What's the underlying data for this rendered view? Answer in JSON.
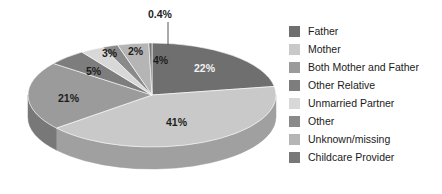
{
  "chart_data": {
    "type": "pie",
    "title": "",
    "subtitle": "",
    "xlabel": "",
    "ylabel": "",
    "three_d": true,
    "legend_position": "right",
    "grid": false,
    "categories": [
      "Father",
      "Mother",
      "Both Mother and Father",
      "Other Relative",
      "Unmarried Partner",
      "Other",
      "Unknown/missing",
      "Childcare Provider"
    ],
    "values": [
      22,
      41,
      21,
      5,
      3,
      2,
      4,
      0.4
    ],
    "labels": [
      "22%",
      "41%",
      "21%",
      "5%",
      "3%",
      "2%",
      "4%",
      "0.4%"
    ],
    "colors": [
      "#6f6f6f",
      "#c9c9c9",
      "#9b9b9b",
      "#7d7d7d",
      "#d8d8d8",
      "#8a8a8a",
      "#b5b5b5",
      "#787878"
    ],
    "side_colors": [
      "#545454",
      "#a0a0a0",
      "#787878",
      "#5f5f5f",
      "#aeaeae",
      "#6b6b6b",
      "#8f8f8f",
      "#5c5c5c"
    ],
    "label_text_colors": [
      "#f2f2f2",
      "#1d1d1d",
      "#1d1d1d",
      "#1d1d1d",
      "#1d1d1d",
      "#1d1d1d",
      "#1d1d1d",
      "#1d1d1d"
    ]
  },
  "legend": {
    "items": [
      {
        "label": "Father",
        "color": "#6f6f6f"
      },
      {
        "label": "Mother",
        "color": "#c9c9c9"
      },
      {
        "label": "Both Mother and Father",
        "color": "#9b9b9b"
      },
      {
        "label": "Other Relative",
        "color": "#7d7d7d"
      },
      {
        "label": "Unmarried Partner",
        "color": "#d8d8d8"
      },
      {
        "label": "Other",
        "color": "#8a8a8a"
      },
      {
        "label": "Unknown/missing",
        "color": "#b5b5b5"
      },
      {
        "label": "Childcare Provider",
        "color": "#787878"
      }
    ]
  },
  "slice_labels": {
    "father": "22%",
    "mother": "41%",
    "both_mother_and_father": "21%",
    "other_relative": "5%",
    "unmarried_partner": "3%",
    "other": "2%",
    "unknown_missing": "4%",
    "childcare_provider": "0.4%"
  }
}
